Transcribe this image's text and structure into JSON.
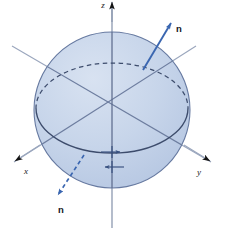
{
  "figure": {
    "canvas": {
      "width": 225,
      "height": 230,
      "background": "#ffffff"
    }
  },
  "colors": {
    "sphere_fill": "#c5d4ea",
    "sphere_stroke": "#5f7096",
    "disk_stroke": "#404f6e",
    "axis_stroke": "#9aa6bd",
    "axis_vertical_stroke": "#8d99b0",
    "axis_arrowhead": "#141414",
    "vector_blue": "#3a66b0",
    "label_dark": "#15151c"
  },
  "axes": [
    {
      "name": "z",
      "label": "z",
      "direction": "up",
      "label_pos": {
        "x": 103,
        "y": 7
      },
      "arrow_at": {
        "x": 112,
        "y": 3
      },
      "line": {
        "x1": 112,
        "y1": 4,
        "x2": 112,
        "y2": 228
      }
    },
    {
      "name": "x",
      "label": "x",
      "direction": "down-left",
      "label_pos": {
        "x": 26,
        "y": 173
      },
      "arrow_at": {
        "x": 12,
        "y": 163
      },
      "line": {
        "x1": 196,
        "y1": 46,
        "x2": 14,
        "y2": 162
      }
    },
    {
      "name": "y",
      "label": "y",
      "direction": "down-right",
      "label_pos": {
        "x": 199,
        "y": 174
      },
      "arrow_at": {
        "x": 213,
        "y": 163
      },
      "line": {
        "x1": 12,
        "y1": 46,
        "x2": 211,
        "y2": 162
      }
    }
  ],
  "sphere": {
    "name": "sphere",
    "center": {
      "x": 112,
      "y": 110
    },
    "radius": 78,
    "fill": "#c5d4ea",
    "stroke": "#5f7096"
  },
  "disk": {
    "name": "equatorial-disk",
    "center": {
      "x": 112,
      "y": 108
    },
    "rx": 76,
    "ry": 45,
    "back_arc_style": "dashed",
    "front_arc_style": "solid"
  },
  "vectors": [
    {
      "name": "normal-up",
      "label": "n",
      "style": "solid",
      "color": "#3a66b0",
      "from": {
        "x": 143,
        "y": 70
      },
      "to": {
        "x": 172,
        "y": 22
      },
      "label_pos": {
        "x": 176,
        "y": 32
      }
    },
    {
      "name": "normal-down",
      "label": "n",
      "style": "dashed",
      "color": "#3a66b0",
      "from": {
        "x": 84,
        "y": 155
      },
      "to": {
        "x": 57,
        "y": 196
      },
      "label_pos": {
        "x": 58,
        "y": 212
      }
    }
  ],
  "circulation_arrows": [
    {
      "name": "circulation-arrow-right",
      "direction": "right",
      "from": {
        "x": 101,
        "y": 152
      },
      "to": {
        "x": 121,
        "y": 152
      }
    },
    {
      "name": "circulation-arrow-left",
      "direction": "left",
      "from": {
        "x": 124,
        "y": 167
      },
      "to": {
        "x": 104,
        "y": 167
      }
    }
  ],
  "tick_marks": [
    {
      "name": "tick-upper",
      "x": 112,
      "y1": 146,
      "y2": 158
    },
    {
      "name": "tick-lower",
      "x": 112,
      "y1": 161,
      "y2": 173
    }
  ]
}
